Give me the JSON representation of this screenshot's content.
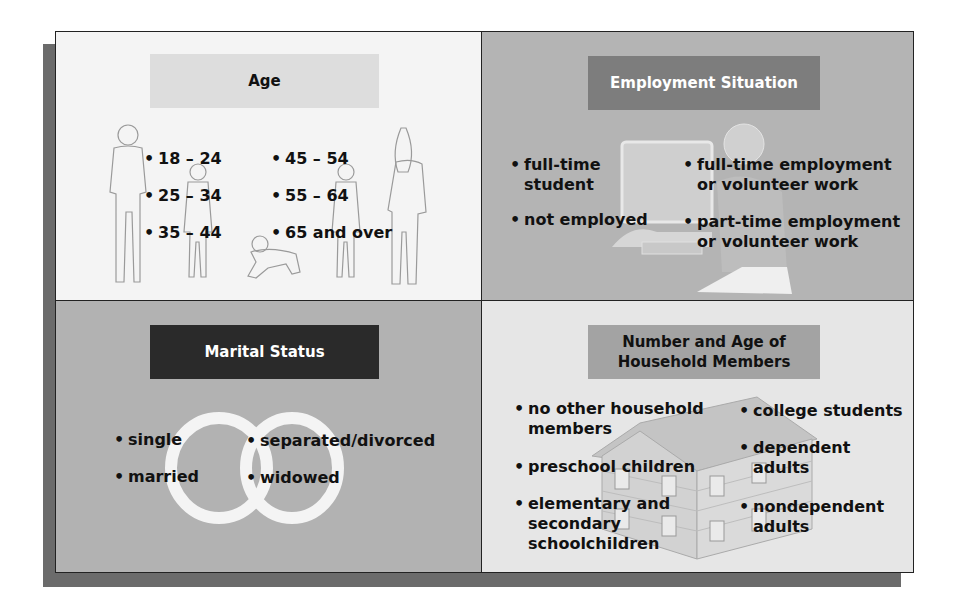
{
  "diagram": {
    "panels": {
      "age": {
        "title": "Age",
        "items_left": [
          "18 – 24",
          "25 – 34",
          "35 – 44"
        ],
        "items_right": [
          "45 – 54",
          "55 – 64",
          "65 and over"
        ],
        "illustration": "family-figures"
      },
      "employment": {
        "title": "Employment Situation",
        "items_left": [
          {
            "line1": "full-time",
            "line2": "student"
          },
          {
            "line1": "not employed",
            "line2": ""
          }
        ],
        "items_right": [
          {
            "line1": "full-time employment",
            "line2": "or volunteer work"
          },
          {
            "line1": "part-time employment",
            "line2": "or volunteer work"
          }
        ],
        "illustration": "person-at-computer"
      },
      "marital": {
        "title": "Marital Status",
        "items_left": [
          "single",
          "married"
        ],
        "items_right": [
          "separated/divorced",
          "widowed"
        ],
        "illustration": "wedding-rings"
      },
      "household": {
        "title_line1": "Number and Age of",
        "title_line2": "Household Members",
        "items_left": [
          {
            "line1": "no other household",
            "line2": "members",
            "line3": ""
          },
          {
            "line1": "preschool children",
            "line2": "",
            "line3": ""
          },
          {
            "line1": "elementary and",
            "line2": "secondary",
            "line3": "schoolchildren"
          }
        ],
        "items_right": [
          {
            "line1": "college students",
            "line2": ""
          },
          {
            "line1": "dependent",
            "line2": "adults"
          },
          {
            "line1": "nondependent",
            "line2": "adults"
          }
        ],
        "illustration": "house"
      }
    },
    "colors": {
      "age_bg": "#f4f4f4",
      "employment_bg": "#b4b4b4",
      "marital_bg": "#b2b2b2",
      "household_bg": "#e6e6e6",
      "age_title_bg": "#dddddd",
      "employment_title_bg": "#7d7d7d",
      "marital_title_bg": "#2a2a2a",
      "household_title_bg": "#a3a3a3"
    }
  }
}
